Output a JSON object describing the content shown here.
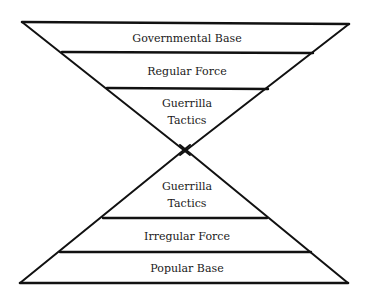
{
  "diagram": {
    "type": "inverted-and-upright-pyramids",
    "top_pyramid": {
      "orientation": "inverted",
      "layers": [
        {
          "label": "Governmental Base"
        },
        {
          "label": "Regular Force"
        },
        {
          "label_line1": "Guerrilla",
          "label_line2": "Tactics"
        }
      ]
    },
    "bottom_pyramid": {
      "orientation": "upright",
      "layers": [
        {
          "label_line1": "Guerrilla",
          "label_line2": "Tactics"
        },
        {
          "label": "Irregular Force"
        },
        {
          "label": "Popular Base"
        }
      ]
    },
    "colors": {
      "line": "#111111",
      "text": "#1a1a1a",
      "background": "#ffffff"
    }
  }
}
